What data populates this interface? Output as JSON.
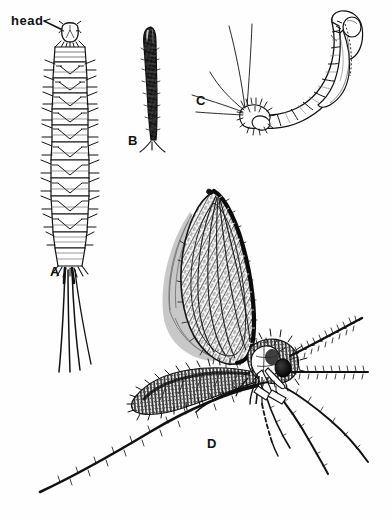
{
  "figure": {
    "kind": "scientific-illustration-plate",
    "background_color": "#fefefe",
    "ink_color": "#111111",
    "width": 391,
    "height": 519,
    "callouts": [
      {
        "id": "head",
        "text": "head",
        "x": 11,
        "y": 14,
        "leader_to_x": 68,
        "leader_to_y": 34
      }
    ],
    "panels": [
      {
        "id": "A",
        "label": "A",
        "label_x": 50,
        "label_y": 265,
        "subject": "larva",
        "description": "dorsal view of segmented larva with head capsule, lateral setae and four long caudal filaments"
      },
      {
        "id": "B",
        "label": "B",
        "label_x": 128,
        "label_y": 134,
        "subject": "dark-elongate-stage",
        "description": "slender dark elongate body with paired terminal processes"
      },
      {
        "id": "C",
        "label": "C",
        "label_x": 196,
        "label_y": 94,
        "subject": "pupa",
        "description": "lateral view of curved pupa attached to bristly larval exuvia with long trailing setae"
      },
      {
        "id": "D",
        "label": "D",
        "label_x": 207,
        "label_y": 437,
        "subject": "adult",
        "description": "lateral view of adult fly with large lanceolate hairy wing, hairy thorax and abdomen, beaded antennae and long legs"
      }
    ]
  }
}
